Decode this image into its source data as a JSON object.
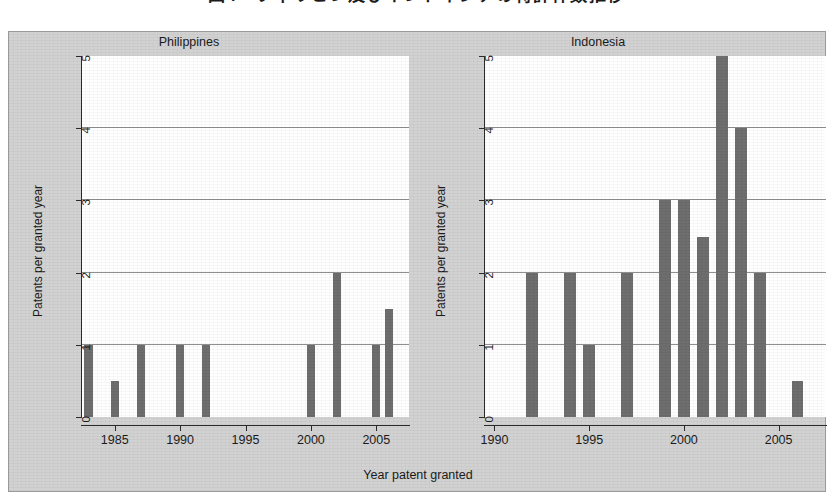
{
  "figure": {
    "top_title_cropped": "図4　フィリピン及びインドネシアの特許件数推移",
    "x_axis_label": "Year patent granted",
    "y_axis_label": "Patents per granted year",
    "bar_color": "#6e6e6e",
    "background_color": "#d2d2d2",
    "plot_background_color": "#ffffff",
    "axis_color": "#2b2b2b",
    "gridline_color": "#8f8f8f"
  },
  "chart_data": [
    {
      "type": "bar",
      "title": "Philippines",
      "xlabel": "Year patent granted",
      "ylabel": "Patents per granted year",
      "ylim": [
        0,
        5
      ],
      "yticks": [
        0,
        1,
        2,
        3,
        4,
        5
      ],
      "xlim": [
        1983,
        2007
      ],
      "xticks": [
        1985,
        1990,
        1995,
        2000,
        2005
      ],
      "grid": true,
      "categories": [
        1983,
        1984,
        1985,
        1986,
        1987,
        1988,
        1989,
        1990,
        1991,
        1992,
        1993,
        1994,
        1995,
        1996,
        1997,
        1998,
        1999,
        2000,
        2001,
        2002,
        2003,
        2004,
        2005,
        2006
      ],
      "values": [
        1,
        0,
        0.5,
        0,
        1,
        0,
        0,
        1,
        0,
        1,
        0,
        0,
        0,
        0,
        0,
        0,
        0,
        1,
        0,
        2,
        0,
        0,
        1,
        1.5
      ]
    },
    {
      "type": "bar",
      "title": "Indonesia",
      "xlabel": "Year patent granted",
      "ylabel": "Patents per granted year",
      "ylim": [
        0,
        5
      ],
      "yticks": [
        0,
        1,
        2,
        3,
        4,
        5
      ],
      "xlim": [
        1990,
        2007
      ],
      "xticks": [
        1990,
        1995,
        2000,
        2005
      ],
      "grid": true,
      "categories": [
        1990,
        1991,
        1992,
        1993,
        1994,
        1995,
        1996,
        1997,
        1998,
        1999,
        2000,
        2001,
        2002,
        2003,
        2004,
        2005,
        2006
      ],
      "values": [
        0,
        0,
        2,
        0,
        2,
        1,
        0,
        2,
        0,
        3,
        3,
        2.5,
        5,
        4,
        2,
        0,
        0.5
      ]
    }
  ]
}
